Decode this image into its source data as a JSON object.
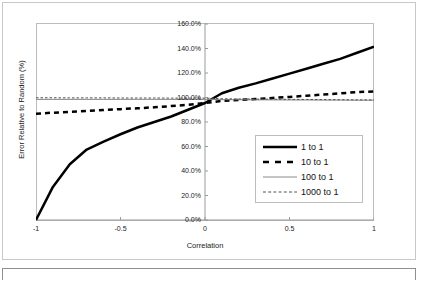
{
  "chart_data": {
    "type": "line",
    "title": "",
    "xlabel": "Correlation",
    "ylabel": "Error Relative to Random (%)",
    "xlim": [
      -1,
      1
    ],
    "ylim": [
      0,
      1.6
    ],
    "grid": false,
    "legend_position": "inside-right",
    "x_ticks": [
      -1,
      -0.5,
      0,
      0.5,
      1
    ],
    "x_tick_labels": [
      "-1",
      "-0.5",
      "0",
      "0.5",
      "1"
    ],
    "y_ticks": [
      0,
      0.2,
      0.4,
      0.6,
      0.8,
      1.0,
      1.2,
      1.4,
      1.6
    ],
    "y_tick_labels": [
      "0.0%",
      "20.0%",
      "40.0%",
      "60.0%",
      "80.0%",
      "100.0%",
      "120.0%",
      "140.0%",
      "160.0%"
    ],
    "x": [
      -1,
      -0.9,
      -0.8,
      -0.7,
      -0.6,
      -0.5,
      -0.4,
      -0.3,
      -0.2,
      -0.1,
      0,
      0.1,
      0.2,
      0.3,
      0.4,
      0.5,
      0.6,
      0.7,
      0.8,
      0.9,
      1
    ],
    "series": [
      {
        "name": "1 to 1",
        "style": "thick-solid",
        "color": "#000000",
        "values": [
          0.0,
          0.27,
          0.455,
          0.575,
          0.64,
          0.7,
          0.755,
          0.8,
          0.845,
          0.9,
          0.955,
          1.035,
          1.08,
          1.115,
          1.155,
          1.195,
          1.235,
          1.275,
          1.315,
          1.365,
          1.415
        ]
      },
      {
        "name": "10 to 1",
        "style": "thick-dashed",
        "color": "#000000",
        "values": [
          0.868,
          0.876,
          0.883,
          0.89,
          0.897,
          0.905,
          0.912,
          0.92,
          0.93,
          0.94,
          0.955,
          0.972,
          0.98,
          0.988,
          0.996,
          1.005,
          1.014,
          1.024,
          1.034,
          1.044,
          1.05
        ]
      },
      {
        "name": "100 to 1",
        "style": "thin-solid",
        "color": "#808080",
        "values": [
          0.985,
          0.985,
          0.985,
          0.985,
          0.985,
          0.985,
          0.985,
          0.985,
          0.985,
          0.985,
          0.985,
          0.982,
          0.982,
          0.981,
          0.981,
          0.98,
          0.98,
          0.979,
          0.979,
          0.978,
          0.978
        ]
      },
      {
        "name": "1000 to 1",
        "style": "thin-dotted",
        "color": "#555555",
        "values": [
          0.998,
          0.998,
          0.997,
          0.997,
          0.997,
          0.996,
          0.996,
          0.996,
          0.995,
          0.995,
          0.995,
          0.99,
          0.988,
          0.987,
          0.986,
          0.985,
          0.984,
          0.983,
          0.982,
          0.981,
          0.98
        ]
      }
    ]
  },
  "legend": {
    "items": [
      {
        "label": "1 to 1"
      },
      {
        "label": "10 to 1"
      },
      {
        "label": "100 to 1"
      },
      {
        "label": "1000 to 1"
      }
    ]
  }
}
